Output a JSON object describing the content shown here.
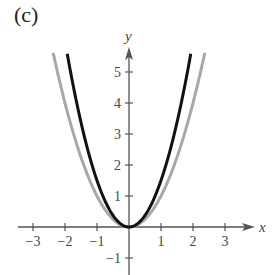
{
  "panel_label": "(c)",
  "chart_data": {
    "type": "line",
    "title": "",
    "xlabel": "x",
    "ylabel": "y",
    "xlim": [
      -3.3,
      3.8
    ],
    "ylim": [
      -1.5,
      5.6
    ],
    "grid": false,
    "legend": null,
    "x_ticks": [
      -3,
      -2,
      -1,
      1,
      2,
      3
    ],
    "x_tick_labels": [
      "−3",
      "−2",
      "−1",
      "1",
      "2",
      "3"
    ],
    "y_ticks": [
      -1,
      1,
      2,
      3,
      4,
      5
    ],
    "y_tick_labels": [
      "−1",
      "1",
      "2",
      "3",
      "4",
      "5"
    ],
    "series": [
      {
        "name": "gray parabola",
        "formula": "y = x^2",
        "color": "#a8a8a8",
        "x_range": [
          -2.37,
          2.37
        ],
        "x": [
          -2.37,
          -2,
          -1.5,
          -1,
          -0.5,
          0,
          0.5,
          1,
          1.5,
          2,
          2.37
        ],
        "y": [
          5.62,
          4,
          2.25,
          1,
          0.25,
          0,
          0.25,
          1,
          2.25,
          4,
          5.62
        ]
      },
      {
        "name": "black parabola",
        "formula": "y = 1.5x^2",
        "color": "#111111",
        "x_range": [
          -1.93,
          1.93
        ],
        "x": [
          -1.93,
          -1.5,
          -1,
          -0.5,
          0,
          0.5,
          1,
          1.5,
          1.93
        ],
        "y": [
          5.59,
          3.375,
          1.5,
          0.375,
          0,
          0.375,
          1.5,
          3.375,
          5.59
        ]
      }
    ]
  },
  "layout": {
    "origin_px": [
      129,
      227
    ],
    "x_unit_px": 32,
    "y_unit_px": 31
  }
}
